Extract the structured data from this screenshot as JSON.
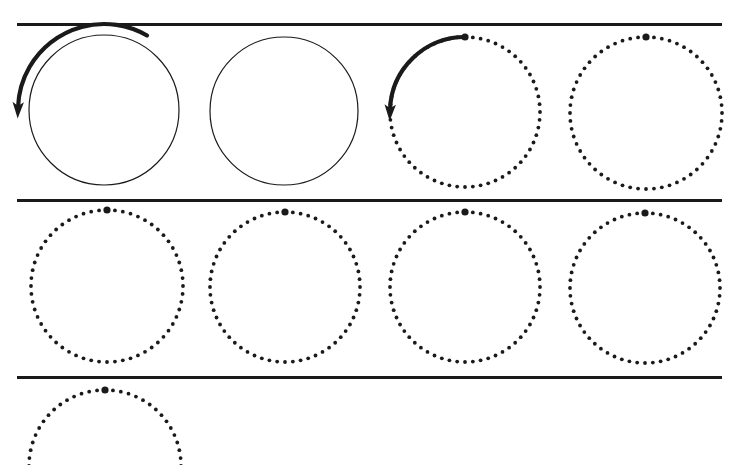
{
  "figure": {
    "title": "",
    "background_color": "#ffffff",
    "stroke_color": "#1a1a1a",
    "width": 731,
    "height": 465
  },
  "separators": [
    {
      "name": "separator-top",
      "x1": 17,
      "x2": 722,
      "y": 24,
      "thickness": 3
    },
    {
      "name": "separator-middle",
      "x1": 17,
      "x2": 722,
      "y": 200,
      "thickness": 3
    },
    {
      "name": "separator-bottom",
      "x1": 17,
      "x2": 722,
      "y": 377,
      "thickness": 3
    }
  ],
  "rows": [
    {
      "name": "row-1",
      "circles": [
        {
          "name": "circle-solid-1",
          "style": "solid",
          "cx": 104,
          "cy": 110,
          "r": 75,
          "line_width": 1.2,
          "marker": null,
          "arrow": {
            "name": "rotation-arrow-ccw",
            "direction": "counterclockwise",
            "start_angle_deg": 300,
            "end_angle_deg": 182,
            "radius_offset": 11,
            "line_width": 4.2,
            "head_size": 11
          }
        },
        {
          "name": "circle-solid-2",
          "style": "solid",
          "cx": 284,
          "cy": 111,
          "r": 74,
          "line_width": 1.2,
          "marker": null,
          "arrow": null
        },
        {
          "name": "circle-dotted-3",
          "style": "dotted",
          "cx": 465,
          "cy": 112,
          "r": 75,
          "dot_count": 60,
          "dot_radius": 1.9,
          "marker": {
            "name": "phase-marker",
            "angle_deg": 270,
            "radius": 3.6
          },
          "arrow": {
            "name": "rotation-arrow-ccw",
            "direction": "counterclockwise",
            "start_angle_deg": 270,
            "end_angle_deg": 182,
            "radius_offset": 0,
            "line_width": 4.2,
            "head_size": 11
          }
        },
        {
          "name": "circle-dotted-4",
          "style": "dotted",
          "cx": 646,
          "cy": 113,
          "r": 76,
          "dot_count": 60,
          "dot_radius": 1.9,
          "marker": {
            "name": "phase-marker",
            "angle_deg": 270,
            "radius": 3.6
          },
          "arrow": null
        }
      ]
    },
    {
      "name": "row-2",
      "circles": [
        {
          "name": "circle-dotted-5",
          "style": "dotted",
          "cx": 107,
          "cy": 286,
          "r": 76,
          "dot_count": 60,
          "dot_radius": 1.9,
          "marker": {
            "name": "phase-marker",
            "angle_deg": 270,
            "radius": 3.6
          },
          "arrow": null
        },
        {
          "name": "circle-dotted-6",
          "style": "dotted",
          "cx": 285,
          "cy": 287,
          "r": 75,
          "dot_count": 60,
          "dot_radius": 1.9,
          "marker": {
            "name": "phase-marker",
            "angle_deg": 270,
            "radius": 3.6
          },
          "arrow": null
        },
        {
          "name": "circle-dotted-7",
          "style": "dotted",
          "cx": 465,
          "cy": 287,
          "r": 75,
          "dot_count": 60,
          "dot_radius": 1.9,
          "marker": {
            "name": "phase-marker",
            "angle_deg": 270,
            "radius": 3.6
          },
          "arrow": null
        },
        {
          "name": "circle-dotted-8",
          "style": "dotted",
          "cx": 645,
          "cy": 288,
          "r": 75,
          "dot_count": 60,
          "dot_radius": 1.9,
          "marker": {
            "name": "phase-marker",
            "angle_deg": 270,
            "radius": 3.6
          },
          "arrow": null
        }
      ]
    },
    {
      "name": "row-3",
      "circles": [
        {
          "name": "circle-dotted-9",
          "style": "dotted",
          "cx": 105,
          "cy": 466,
          "r": 76,
          "dot_count": 60,
          "dot_radius": 1.9,
          "marker": {
            "name": "phase-marker",
            "angle_deg": 270,
            "radius": 3.6
          },
          "arrow": null,
          "clipped": true
        }
      ]
    }
  ]
}
